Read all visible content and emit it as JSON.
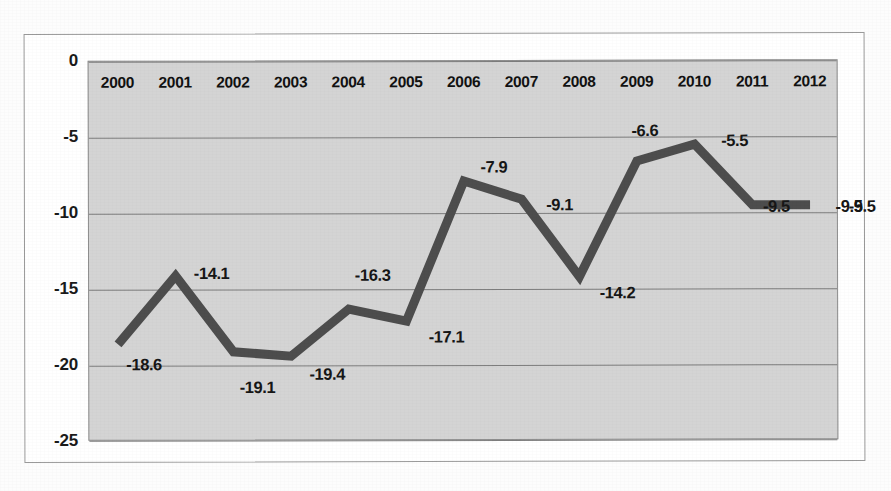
{
  "chart_data": {
    "type": "line",
    "title": "",
    "subtitle": "",
    "xlabel": "",
    "ylabel": "",
    "categories": [
      "2000",
      "2001",
      "2002",
      "2003",
      "2004",
      "2005",
      "2006",
      "2007",
      "2008",
      "2009",
      "2010",
      "2011",
      "2012"
    ],
    "values": [
      -18.6,
      -14.1,
      -19.1,
      -19.4,
      -16.3,
      -17.1,
      -7.9,
      -9.1,
      -14.2,
      -6.6,
      -5.5,
      -9.5,
      -9.5
    ],
    "point_labels": [
      "-18.6",
      "-14.1",
      "-19.1",
      "-19.4",
      "-16.3",
      "-17.1",
      "-7.9",
      "-9.1",
      "-14.2",
      "-6.6",
      "-5.5",
      "-9.5",
      "-9.5"
    ],
    "extra_annotations": [
      {
        "text": "-9.5",
        "note": "duplicate value label placed right of the 2012 point, outside the plot panel"
      }
    ],
    "ylim": [
      -25,
      0
    ],
    "y_ticks": [
      "0",
      "-5",
      "-10",
      "-15",
      "-20",
      "-25"
    ],
    "y_tick_values": [
      0,
      -5,
      -10,
      -15,
      -20,
      -25
    ],
    "grid": true,
    "grid_axis": "y",
    "legend": "none",
    "legend_position": "none",
    "series": [
      {
        "name": "",
        "values": [
          -18.6,
          -14.1,
          -19.1,
          -19.4,
          -16.3,
          -17.1,
          -7.9,
          -9.1,
          -14.2,
          -6.6,
          -5.5,
          -9.5,
          -9.5
        ]
      }
    ],
    "colors": {
      "line": "#4d4d4d",
      "plot_background": "#d4d4d4",
      "gridline": "#7d7d7d",
      "text": "#161616",
      "frame": "#9a9a9a",
      "page_background": "#fdfdfd"
    },
    "style_notes": {
      "line_width_px": 9,
      "markers": "none",
      "x_labels_inside_plot_top": true
    }
  },
  "label_offsets": [
    {
      "dx": 26,
      "dy": 20
    },
    {
      "dx": 36,
      "dy": -2
    },
    {
      "dx": 24,
      "dy": 36
    },
    {
      "dx": 36,
      "dy": 18
    },
    {
      "dx": 24,
      "dy": -34
    },
    {
      "dx": 40,
      "dy": 16
    },
    {
      "dx": 30,
      "dy": -14
    },
    {
      "dx": 38,
      "dy": 6
    },
    {
      "dx": 38,
      "dy": 16
    },
    {
      "dx": 8,
      "dy": -30
    },
    {
      "dx": 40,
      "dy": -4
    },
    {
      "dx": 24,
      "dy": 2
    },
    {
      "dx": 52,
      "dy": 2
    }
  ]
}
